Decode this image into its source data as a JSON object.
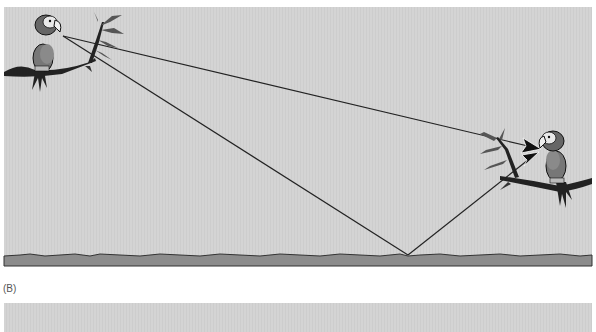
{
  "panels": [
    {
      "id": "A",
      "label": "",
      "description": "Sound propagation between two parrots on branches: direct path and path reflected off the ground",
      "elements": {
        "sender": "parrot-left",
        "receiver": "parrot-right",
        "paths": [
          {
            "name": "direct-path",
            "from": [
              63,
              36
            ],
            "to": [
              540,
              148
            ]
          },
          {
            "name": "reflected-path",
            "from": [
              63,
              36
            ],
            "via": [
              408,
              255
            ],
            "to": [
              538,
              153
            ]
          }
        ],
        "ground": "textured ground strip"
      }
    },
    {
      "id": "B",
      "label": "(B)"
    }
  ],
  "colors": {
    "sky": "#d2d2d2",
    "ground": "#8c8c8c",
    "ground_edge": "#333333",
    "lines": "#222222",
    "arrowheads": "#111111"
  }
}
